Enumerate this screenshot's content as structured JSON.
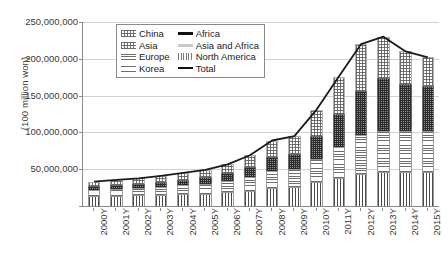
{
  "chart_data": {
    "type": "bar",
    "stacked": true,
    "title": "",
    "xlabel": "",
    "ylabel": "(100 million won)",
    "ylim": [
      0,
      250000000
    ],
    "ytick_labels": [
      "250,000,000",
      "200,000,000",
      "150,000,000",
      "100,000,000",
      "50,000,000",
      "0"
    ],
    "ytick_values": [
      250000000,
      200000000,
      150000000,
      100000000,
      50000000,
      0
    ],
    "grid": true,
    "legend_position": "top-left-inside",
    "categories": [
      "2000Y",
      "2001Y",
      "2002Y",
      "2003Y",
      "2004Y",
      "2005Y",
      "2006Y",
      "2007Y",
      "2008Y",
      "2009Y",
      "2010Y",
      "2011Y",
      "2012Y",
      "2013Y",
      "2014Y",
      "2015Y"
    ],
    "series": [
      {
        "name": "Korea",
        "fill": "vertical-hatch",
        "values": [
          13000000,
          14000000,
          14500000,
          15000000,
          16000000,
          17000000,
          18500000,
          21000000,
          25000000,
          26000000,
          32000000,
          38000000,
          44000000,
          46000000,
          46000000,
          46000000
        ]
      },
      {
        "name": "Europe",
        "fill": "horizontal-hatch",
        "values": [
          9000000,
          9500000,
          10000000,
          11000000,
          12000000,
          13000000,
          15000000,
          18000000,
          23000000,
          24000000,
          32000000,
          42000000,
          52000000,
          56000000,
          56000000,
          56000000
        ]
      },
      {
        "name": "Asia",
        "fill": "dark-checker",
        "values": [
          5000000,
          5500000,
          6000000,
          7000000,
          8000000,
          9000000,
          11000000,
          14000000,
          19000000,
          21000000,
          31000000,
          45000000,
          60000000,
          72000000,
          64000000,
          61000000
        ]
      },
      {
        "name": "China",
        "fill": "light-dots",
        "values": [
          6000000,
          6500000,
          7000000,
          8000000,
          9000000,
          10000000,
          12000000,
          16000000,
          22000000,
          24000000,
          36000000,
          51000000,
          64000000,
          56000000,
          44000000,
          39000000
        ]
      },
      {
        "name": "Africa",
        "fill": "solid-black",
        "values": [
          0,
          0,
          0,
          0,
          0,
          0,
          0,
          0,
          0,
          0,
          0,
          0,
          0,
          0,
          0,
          0
        ]
      },
      {
        "name": "Asia and Africa",
        "fill": "light-gray",
        "values": [
          0,
          0,
          0,
          0,
          0,
          0,
          0,
          0,
          0,
          0,
          0,
          0,
          0,
          0,
          0,
          0
        ]
      },
      {
        "name": "North America",
        "fill": "fine-vertical",
        "values": [
          0,
          0,
          0,
          0,
          0,
          0,
          0,
          0,
          0,
          0,
          0,
          0,
          0,
          0,
          0,
          0
        ]
      }
    ],
    "total_line": {
      "name": "Total",
      "values": [
        33000000,
        35500000,
        37500000,
        41000000,
        45000000,
        49000000,
        56500000,
        69000000,
        89000000,
        95000000,
        131000000,
        176000000,
        220000000,
        230000000,
        210000000,
        202000000
      ]
    }
  },
  "legend": {
    "items": [
      {
        "label": "China",
        "swatch": "light-dots-swatch"
      },
      {
        "label": "Africa",
        "swatch": "solid-black-swatch"
      },
      {
        "label": "Asia",
        "swatch": "light-dots2-swatch"
      },
      {
        "label": "Asia and Africa",
        "swatch": "light-gray-swatch"
      },
      {
        "label": "Europe",
        "swatch": "horizontal-hatch-swatch"
      },
      {
        "label": "North America",
        "swatch": "fine-vertical-swatch"
      },
      {
        "label": "Korea",
        "swatch": "horizontal-hatch2-swatch"
      },
      {
        "label": "Total",
        "swatch": "line-swatch"
      }
    ]
  }
}
